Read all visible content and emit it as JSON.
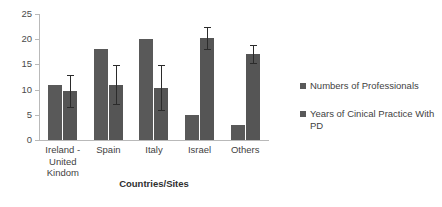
{
  "chart_data": {
    "type": "bar",
    "title": "",
    "xlabel": "Countries/Sites",
    "ylabel": "",
    "ylim": [
      0,
      25
    ],
    "yticks": [
      0,
      5,
      10,
      15,
      20,
      25
    ],
    "grid": false,
    "legend_position": "right",
    "categories": [
      "Ireland - United Kindom",
      "Spain",
      "Italy",
      "Israel",
      "Others"
    ],
    "category_lines": [
      [
        "Ireland -",
        "United",
        "Kindom"
      ],
      [
        "Spain"
      ],
      [
        "Italy"
      ],
      [
        "Israel"
      ],
      [
        "Others"
      ]
    ],
    "series": [
      {
        "name": "Numbers of Professionals",
        "color": "#595959",
        "values": [
          11,
          18,
          20,
          5,
          3
        ],
        "errors": [
          null,
          null,
          null,
          null,
          null
        ]
      },
      {
        "name": "Years of Cinical Practice With PD",
        "color": "#555555",
        "values": [
          9.7,
          11,
          10.4,
          20.2,
          17
        ],
        "errors": [
          3.1,
          3.9,
          4.4,
          2.2,
          1.8
        ]
      }
    ]
  },
  "legend": {
    "entries": [
      {
        "label": "Numbers of Professionals"
      },
      {
        "label": "Years of Cinical Practice With PD"
      }
    ]
  },
  "axis": {
    "x_title": "Countries/Sites",
    "y_tick_labels": [
      "0",
      "5",
      "10",
      "15",
      "20",
      "25"
    ]
  },
  "colors": {
    "series_1": "#595959",
    "series_2": "#555555",
    "axis": "#b9b9b9",
    "error_bar": "#2b2b2b",
    "text": "#3f3f3f",
    "background": "#ffffff"
  }
}
